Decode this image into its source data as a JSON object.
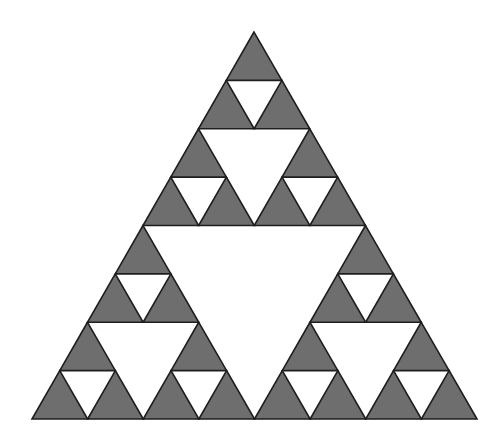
{
  "diagram": {
    "type": "sierpinski-triangle",
    "depth": 3,
    "apex": [
      254,
      32
    ],
    "bottom_left": [
      32,
      419
    ],
    "bottom_right": [
      477,
      419
    ],
    "colors": {
      "background": "#ffffff",
      "fill": "#6e6e6e",
      "stroke": "#1e1e1e"
    },
    "stroke_width": 1.6
  }
}
